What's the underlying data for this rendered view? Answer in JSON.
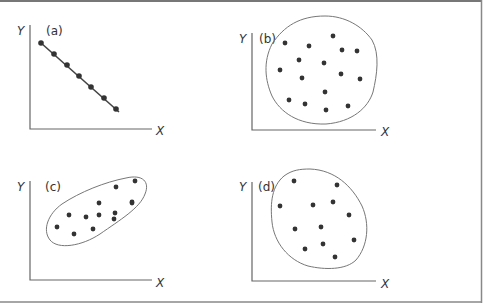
{
  "figure": {
    "border_color": "#888888",
    "axis_color": "#555555",
    "point_color": "#333333",
    "outline_color": "#666666"
  },
  "chart_data": [
    {
      "type": "scatter",
      "title": "(a)",
      "xlabel": "X",
      "ylabel": "Y",
      "description": "perfect negative linear relationship, points connected by line",
      "points": [
        [
          41,
          43
        ],
        [
          54,
          54
        ],
        [
          67,
          65
        ],
        [
          79,
          76
        ],
        [
          91,
          87
        ],
        [
          104,
          98
        ],
        [
          116,
          109
        ]
      ]
    },
    {
      "type": "scatter",
      "title": "(b)",
      "xlabel": "X",
      "ylabel": "Y",
      "description": "no correlation, round cloud",
      "points": [
        [
          285,
          43
        ],
        [
          309,
          46
        ],
        [
          333,
          36
        ],
        [
          342,
          50
        ],
        [
          357,
          51
        ],
        [
          299,
          60
        ],
        [
          324,
          63
        ],
        [
          280,
          70
        ],
        [
          302,
          78
        ],
        [
          341,
          74
        ],
        [
          360,
          79
        ],
        [
          325,
          92
        ],
        [
          289,
          100
        ],
        [
          305,
          104
        ],
        [
          326,
          110
        ],
        [
          348,
          106
        ]
      ]
    },
    {
      "type": "scatter",
      "title": "(c)",
      "xlabel": "X",
      "ylabel": "Y",
      "description": "positive correlation, elongated ellipse",
      "points": [
        [
          116,
          187
        ],
        [
          135,
          181
        ],
        [
          99,
          203
        ],
        [
          115,
          213
        ],
        [
          132,
          202
        ],
        [
          99,
          215
        ],
        [
          57,
          227
        ],
        [
          69,
          215
        ],
        [
          86,
          217
        ],
        [
          74,
          234
        ],
        [
          93,
          229
        ],
        [
          114,
          219
        ],
        [
          132,
          203
        ]
      ]
    },
    {
      "type": "scatter",
      "title": "(d)",
      "xlabel": "X",
      "ylabel": "Y",
      "description": "weak / no correlation, oval cloud",
      "points": [
        [
          294,
          181
        ],
        [
          337,
          185
        ],
        [
          280,
          206
        ],
        [
          313,
          205
        ],
        [
          333,
          202
        ],
        [
          349,
          215
        ],
        [
          295,
          229
        ],
        [
          321,
          227
        ],
        [
          354,
          240
        ],
        [
          305,
          249
        ],
        [
          323,
          244
        ],
        [
          335,
          257
        ]
      ]
    }
  ],
  "panels": [
    {
      "label": "(a)",
      "x_label": "X",
      "y_label": "Y"
    },
    {
      "label": "(b)",
      "x_label": "X",
      "y_label": "Y"
    },
    {
      "label": "(c)",
      "x_label": "X",
      "y_label": "Y"
    },
    {
      "label": "(d)",
      "x_label": "X",
      "y_label": "Y"
    }
  ]
}
